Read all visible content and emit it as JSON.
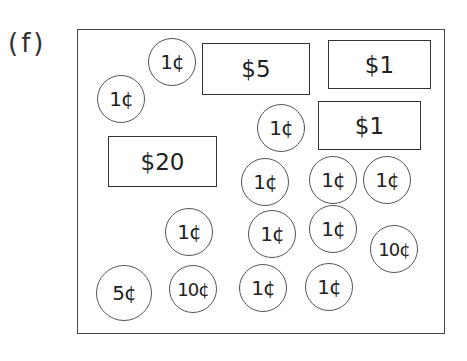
{
  "label": "(f)",
  "bills": [
    {
      "value": "$5",
      "x": 202,
      "y": 43,
      "w": 108,
      "h": 52
    },
    {
      "value": "$1",
      "x": 328,
      "y": 40,
      "w": 103,
      "h": 49
    },
    {
      "value": "$1",
      "x": 318,
      "y": 101,
      "w": 103,
      "h": 49
    },
    {
      "value": "$20",
      "x": 108,
      "y": 136,
      "w": 109,
      "h": 51
    }
  ],
  "coins": [
    {
      "value": "1¢",
      "cx": 172,
      "cy": 62,
      "r": 24
    },
    {
      "value": "1¢",
      "cx": 121,
      "cy": 99,
      "r": 24
    },
    {
      "value": "1¢",
      "cx": 281,
      "cy": 128,
      "r": 24
    },
    {
      "value": "1¢",
      "cx": 265,
      "cy": 182,
      "r": 24
    },
    {
      "value": "1¢",
      "cx": 333,
      "cy": 180,
      "r": 24
    },
    {
      "value": "1¢",
      "cx": 387,
      "cy": 180,
      "r": 24
    },
    {
      "value": "1¢",
      "cx": 189,
      "cy": 232,
      "r": 24
    },
    {
      "value": "1¢",
      "cx": 272,
      "cy": 234,
      "r": 24
    },
    {
      "value": "1¢",
      "cx": 333,
      "cy": 229,
      "r": 24
    },
    {
      "value": "10¢",
      "cx": 394,
      "cy": 249,
      "r": 24
    },
    {
      "value": "5¢",
      "cx": 124,
      "cy": 293,
      "r": 28
    },
    {
      "value": "10¢",
      "cx": 193,
      "cy": 289,
      "r": 24
    },
    {
      "value": "1¢",
      "cx": 263,
      "cy": 288,
      "r": 24
    },
    {
      "value": "1¢",
      "cx": 329,
      "cy": 287,
      "r": 24
    }
  ]
}
